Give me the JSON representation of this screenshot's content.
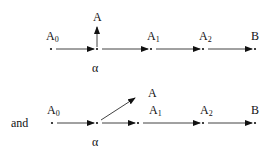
{
  "diagrams": [
    {
      "prefix": "",
      "nodes": [
        {
          "id": "A0",
          "label": "A",
          "sub": "0",
          "x": 51,
          "y": 49,
          "lx": 46,
          "ly": 30
        },
        {
          "id": "alpha",
          "label": "α",
          "sub": "",
          "x": 97,
          "y": 49,
          "lx": 92,
          "ly": 62
        },
        {
          "id": "A1",
          "label": "A",
          "sub": "1",
          "x": 151,
          "y": 49,
          "lx": 147,
          "ly": 30
        },
        {
          "id": "A2",
          "label": "A",
          "sub": "2",
          "x": 203,
          "y": 49,
          "lx": 199,
          "ly": 30
        },
        {
          "id": "B",
          "label": "B",
          "sub": "",
          "x": 255,
          "y": 49,
          "lx": 251,
          "ly": 30
        }
      ],
      "branch": {
        "label": "A",
        "lx": 93,
        "ly": 11,
        "from": [
          97,
          47
        ],
        "to": [
          97,
          27
        ]
      }
    },
    {
      "prefix": "and",
      "nodes": [
        {
          "id": "A0",
          "label": "A",
          "sub": "0",
          "x": 52,
          "y": 123,
          "lx": 47,
          "ly": 104
        },
        {
          "id": "alpha",
          "label": "α",
          "sub": "",
          "x": 97,
          "y": 123,
          "lx": 92,
          "ly": 136
        },
        {
          "id": "A1",
          "label": "A",
          "sub": "1",
          "x": 138,
          "y": 123,
          "lx": 149,
          "ly": 104
        },
        {
          "id": "A2",
          "label": "A",
          "sub": "2",
          "x": 203,
          "y": 123,
          "lx": 200,
          "ly": 104
        },
        {
          "id": "B",
          "label": "B",
          "sub": "",
          "x": 255,
          "y": 123,
          "lx": 251,
          "ly": 104
        }
      ],
      "branch": {
        "label": "A",
        "lx": 148,
        "ly": 87,
        "from": [
          101,
          120
        ],
        "to": [
          135,
          98
        ]
      }
    }
  ]
}
